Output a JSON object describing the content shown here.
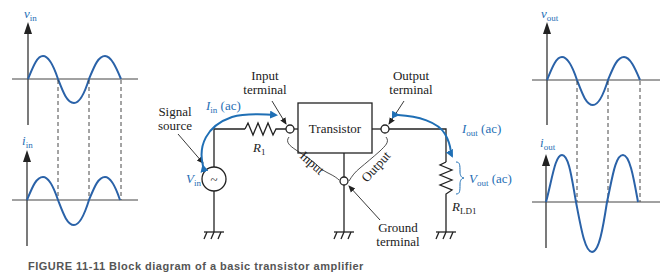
{
  "figure": {
    "colors": {
      "wave": "#2a62a8",
      "ink": "#222222",
      "accent": "#1f6fb5"
    },
    "graphs": {
      "v_in": {
        "symbol": "v",
        "sub": "in"
      },
      "i_in": {
        "symbol": "i",
        "sub": "in"
      },
      "v_out": {
        "symbol": "v",
        "sub": "out"
      },
      "i_out": {
        "symbol": "i",
        "sub": "out"
      }
    },
    "circuit": {
      "transistor_label": "Transistor",
      "input_terminal": [
        "Input",
        "terminal"
      ],
      "output_terminal": [
        "Output",
        "terminal"
      ],
      "ground_terminal": [
        "Ground",
        "terminal"
      ],
      "signal_source": [
        "Signal",
        "source"
      ],
      "source_symbol": "~",
      "i_in": {
        "symbol": "I",
        "sub": "in",
        "suffix": " (ac)"
      },
      "i_out": {
        "symbol": "I",
        "sub": "out",
        "suffix": " (ac)"
      },
      "v_in": {
        "symbol": "V",
        "sub": "in"
      },
      "v_out": {
        "symbol": "V",
        "sub": "out",
        "suffix": " (ac)"
      },
      "r1": {
        "symbol": "R",
        "sub": "1"
      },
      "rld1": {
        "symbol": "R",
        "sub": "LD1"
      },
      "input_brace_label": "Input",
      "output_brace_label": "Output"
    },
    "caption": "FIGURE 11-11  Block diagram of a basic transistor amplifier"
  }
}
